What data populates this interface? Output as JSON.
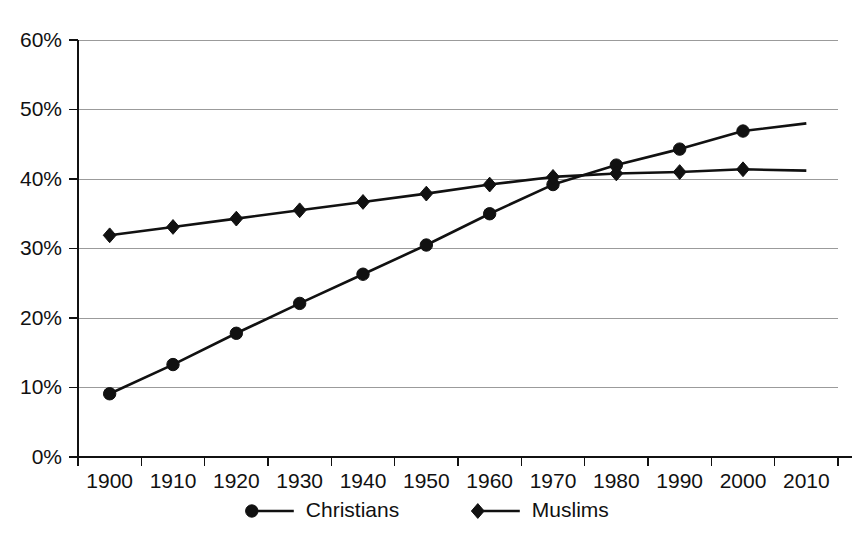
{
  "chart_data": {
    "type": "line",
    "title": "",
    "subtitle": "",
    "xlabel": "",
    "ylabel": "",
    "categories": [
      "1900",
      "1910",
      "1920",
      "1930",
      "1940",
      "1950",
      "1960",
      "1970",
      "1980",
      "1990",
      "2000",
      "2010"
    ],
    "x": [
      1900,
      1910,
      1920,
      1930,
      1940,
      1950,
      1960,
      1970,
      1980,
      1990,
      2000,
      2010
    ],
    "ylim": [
      0,
      60
    ],
    "xlim": [
      1900,
      2010
    ],
    "y_tick_labels": [
      "0%",
      "10%",
      "20%",
      "30%",
      "40%",
      "50%",
      "60%"
    ],
    "y_tick_values": [
      0,
      10,
      20,
      30,
      40,
      50,
      60
    ],
    "x_tick_labels": [
      "1900",
      "1910",
      "1920",
      "1930",
      "1940",
      "1950",
      "1960",
      "1970",
      "1980",
      "1990",
      "2000",
      "2010"
    ],
    "grid": "horizontal",
    "legend_position": "bottom",
    "value_unit": "%",
    "series": [
      {
        "name": "Christians",
        "marker": "circle",
        "color": "#111111",
        "marker_through": 2000,
        "values": [
          9.1,
          13.3,
          17.8,
          22.1,
          26.3,
          30.5,
          35.0,
          39.2,
          42.0,
          44.3,
          46.9,
          48.0
        ]
      },
      {
        "name": "Muslims",
        "marker": "diamond",
        "color": "#111111",
        "marker_through": 2000,
        "values": [
          31.9,
          33.1,
          34.3,
          35.5,
          36.7,
          37.9,
          39.2,
          40.3,
          40.8,
          41.0,
          41.4,
          41.2
        ]
      }
    ],
    "annotations": []
  },
  "legend": {
    "items": [
      {
        "label": "Christians",
        "marker": "circle"
      },
      {
        "label": "Muslims",
        "marker": "diamond"
      }
    ]
  },
  "colors": {
    "ink": "#111111",
    "grid": "#9b9b9b",
    "background": "#ffffff"
  }
}
